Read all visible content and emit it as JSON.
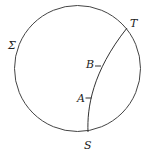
{
  "diagram": {
    "circle": {
      "label": "Σ",
      "cx": 77.5,
      "cy": 68.5,
      "r": 63,
      "stroke": "#444444"
    },
    "arc": {
      "from": "S",
      "to": "T",
      "stroke": "#333333"
    },
    "points": [
      {
        "id": "S",
        "label": "S",
        "x": 88,
        "y": 132,
        "lx": 84,
        "ly": 149
      },
      {
        "id": "T",
        "label": "T",
        "x": 127,
        "y": 28,
        "lx": 130,
        "ly": 27
      },
      {
        "id": "A",
        "label": "A",
        "x": 88.5,
        "y": 98,
        "lx": 77,
        "ly": 102
      },
      {
        "id": "B",
        "label": "B",
        "x": 98,
        "y": 66,
        "lx": 86,
        "ly": 68
      }
    ],
    "sigma_label": {
      "text": "Σ",
      "x": 8,
      "y": 49
    }
  }
}
